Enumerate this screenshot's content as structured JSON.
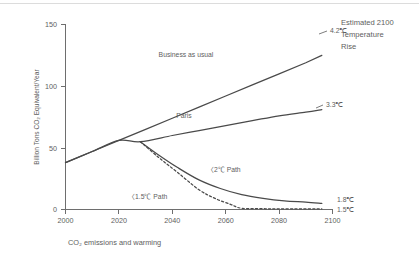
{
  "figure": {
    "caption": "CO₂ emissions and warming",
    "annotation_heading": [
      "Estimated 2100",
      "Temperature",
      "Rise"
    ]
  },
  "colors": {
    "background": "#ffffff",
    "axis": "#6e6e6e",
    "line": "#4a4a4a",
    "text": "#5e5e5e",
    "top_rule": "#dcdcdc"
  },
  "chart_data": {
    "type": "line",
    "title": "",
    "subtitle": "",
    "caption": "CO₂ emissions and warming",
    "xlabel": "",
    "ylabel": "Billion Tons CO₂ Equivalent/Year",
    "xlim": [
      2000,
      2100
    ],
    "ylim": [
      0,
      150
    ],
    "xticks": [
      2000,
      2020,
      2040,
      2060,
      2080,
      2100
    ],
    "xtick_labels": [
      "2000",
      "2020",
      "2040",
      "2060",
      "2080",
      "2100"
    ],
    "yticks": [
      0,
      50,
      100,
      150
    ],
    "ytick_labels": [
      "0",
      "50",
      "100",
      "150"
    ],
    "grid": false,
    "legend": "none",
    "annotations": [
      {
        "text": "Estimated 2100",
        "x": 2105,
        "y": 148
      },
      {
        "text": "Temperature",
        "x": 2105,
        "y": 139
      },
      {
        "text": "Rise",
        "x": 2105,
        "y": 130
      }
    ],
    "series": [
      {
        "name": "Business as usual",
        "style": "solid",
        "label": "Business as usual",
        "label_x": 2045,
        "label_y": 108,
        "endpoint_label": "4.2℃",
        "x": [
          2000,
          2010,
          2020,
          2030,
          2040,
          2050,
          2060,
          2070,
          2080,
          2090,
          2096
        ],
        "y": [
          38,
          47,
          56,
          65,
          74,
          83,
          92,
          101,
          110,
          119,
          125
        ]
      },
      {
        "name": "Paris",
        "style": "solid",
        "label": "Paris",
        "label_x": 2044,
        "label_y": 72,
        "endpoint_label": "3.3℃",
        "x": [
          2000,
          2010,
          2020,
          2028,
          2040,
          2050,
          2060,
          2070,
          2080,
          2090,
          2096
        ],
        "y": [
          38,
          47,
          56,
          55,
          60,
          64,
          68,
          72,
          76,
          79,
          81
        ]
      },
      {
        "name": "2℃ Path",
        "style": "solid",
        "label": "〈2℃ Path",
        "label_x": 2047,
        "label_y": 31,
        "endpoint_label": "1.8℃",
        "x": [
          2028,
          2035,
          2042,
          2050,
          2058,
          2066,
          2074,
          2082,
          2090,
          2096
        ],
        "y": [
          55,
          44,
          34,
          24,
          17,
          12,
          9,
          7,
          6,
          5
        ]
      },
      {
        "name": "1.5℃ Path",
        "style": "dashed",
        "label": "〈1.5℃ Path",
        "label_x": 2021,
        "label_y": 13,
        "endpoint_label": "1.5℃",
        "x": [
          2028,
          2035,
          2042,
          2050,
          2056,
          2062,
          2066,
          2075,
          2085,
          2096
        ],
        "y": [
          55,
          42,
          30,
          16,
          9,
          4,
          1,
          0.6,
          0.5,
          0.5
        ]
      }
    ]
  }
}
